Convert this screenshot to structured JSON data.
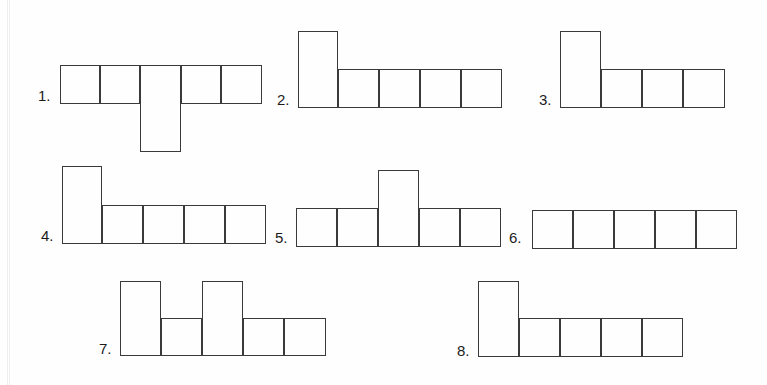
{
  "page": {
    "background_color": "#fefefe",
    "line_color": "#3a3a3a",
    "label_color": "#1c1c1c",
    "unit": 40
  },
  "figures": [
    {
      "id": "figure-1",
      "label": "1.",
      "label_x": 38,
      "label_y": 88,
      "origin_x": 60,
      "origin_y": 65,
      "cells": [
        {
          "x": 0,
          "y": 0,
          "w": 40,
          "h": 39
        },
        {
          "x": 40,
          "y": 0,
          "w": 40,
          "h": 39
        },
        {
          "x": 80,
          "y": 0,
          "w": 41,
          "h": 87
        },
        {
          "x": 121,
          "y": 0,
          "w": 40,
          "h": 39
        },
        {
          "x": 161,
          "y": 0,
          "w": 41,
          "h": 39
        }
      ]
    },
    {
      "id": "figure-2",
      "label": "2.",
      "label_x": 277,
      "label_y": 92,
      "origin_x": 298,
      "origin_y": 31,
      "cells": [
        {
          "x": 0,
          "y": 0,
          "w": 40,
          "h": 77
        },
        {
          "x": 40,
          "y": 38,
          "w": 41,
          "h": 39
        },
        {
          "x": 81,
          "y": 38,
          "w": 41,
          "h": 39
        },
        {
          "x": 122,
          "y": 38,
          "w": 41,
          "h": 39
        },
        {
          "x": 163,
          "y": 38,
          "w": 41,
          "h": 39
        }
      ]
    },
    {
      "id": "figure-3",
      "label": "3.",
      "label_x": 539,
      "label_y": 92,
      "origin_x": 560,
      "origin_y": 31,
      "cells": [
        {
          "x": 0,
          "y": 0,
          "w": 41,
          "h": 77
        },
        {
          "x": 41,
          "y": 38,
          "w": 41,
          "h": 39
        },
        {
          "x": 82,
          "y": 38,
          "w": 41,
          "h": 39
        },
        {
          "x": 123,
          "y": 38,
          "w": 42,
          "h": 39
        }
      ]
    },
    {
      "id": "figure-4",
      "label": "4.",
      "label_x": 41,
      "label_y": 228,
      "origin_x": 62,
      "origin_y": 166,
      "cells": [
        {
          "x": 0,
          "y": 0,
          "w": 40,
          "h": 78
        },
        {
          "x": 40,
          "y": 39,
          "w": 41,
          "h": 39
        },
        {
          "x": 81,
          "y": 39,
          "w": 41,
          "h": 39
        },
        {
          "x": 122,
          "y": 39,
          "w": 41,
          "h": 39
        },
        {
          "x": 163,
          "y": 39,
          "w": 41,
          "h": 39
        }
      ]
    },
    {
      "id": "figure-5",
      "label": "5.",
      "label_x": 275,
      "label_y": 230,
      "origin_x": 296,
      "origin_y": 170,
      "cells": [
        {
          "x": 0,
          "y": 38,
          "w": 41,
          "h": 39
        },
        {
          "x": 41,
          "y": 38,
          "w": 41,
          "h": 39
        },
        {
          "x": 82,
          "y": 0,
          "w": 41,
          "h": 77
        },
        {
          "x": 123,
          "y": 38,
          "w": 41,
          "h": 39
        },
        {
          "x": 164,
          "y": 38,
          "w": 41,
          "h": 39
        }
      ]
    },
    {
      "id": "figure-6",
      "label": "6.",
      "label_x": 509,
      "label_y": 230,
      "origin_x": 532,
      "origin_y": 210,
      "cells": [
        {
          "x": 0,
          "y": 0,
          "w": 41,
          "h": 39
        },
        {
          "x": 41,
          "y": 0,
          "w": 41,
          "h": 39
        },
        {
          "x": 82,
          "y": 0,
          "w": 41,
          "h": 39
        },
        {
          "x": 123,
          "y": 0,
          "w": 41,
          "h": 39
        },
        {
          "x": 164,
          "y": 0,
          "w": 41,
          "h": 39
        }
      ]
    },
    {
      "id": "figure-7",
      "label": "7.",
      "label_x": 99,
      "label_y": 341,
      "origin_x": 120,
      "origin_y": 281,
      "cells": [
        {
          "x": 0,
          "y": 0,
          "w": 41,
          "h": 75
        },
        {
          "x": 41,
          "y": 37,
          "w": 41,
          "h": 38
        },
        {
          "x": 82,
          "y": 0,
          "w": 41,
          "h": 75
        },
        {
          "x": 123,
          "y": 37,
          "w": 41,
          "h": 38
        },
        {
          "x": 164,
          "y": 37,
          "w": 42,
          "h": 38
        }
      ]
    },
    {
      "id": "figure-8",
      "label": "8.",
      "label_x": 457,
      "label_y": 343,
      "origin_x": 478,
      "origin_y": 281,
      "cells": [
        {
          "x": 0,
          "y": 0,
          "w": 41,
          "h": 76
        },
        {
          "x": 41,
          "y": 37,
          "w": 41,
          "h": 39
        },
        {
          "x": 82,
          "y": 37,
          "w": 41,
          "h": 39
        },
        {
          "x": 123,
          "y": 37,
          "w": 41,
          "h": 39
        },
        {
          "x": 164,
          "y": 37,
          "w": 41,
          "h": 39
        }
      ]
    }
  ],
  "scan_artifacts": [
    {
      "x": 7
    },
    {
      "x": 9
    }
  ]
}
